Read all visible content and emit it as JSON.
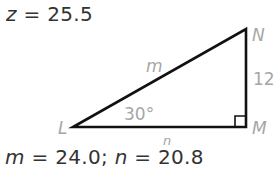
{
  "header": {
    "variable": "z",
    "equals": "=",
    "value": "25.5"
  },
  "triangle": {
    "vertices": {
      "L": {
        "label": "L",
        "x": 73,
        "y": 127
      },
      "M": {
        "label": "M",
        "x": 246,
        "y": 127
      },
      "N": {
        "label": "N",
        "x": 246,
        "y": 29
      }
    },
    "sides": {
      "hypotenuse_label": "m",
      "base_label": "n",
      "vertical_label": "12"
    },
    "angle_label": "30°",
    "right_angle_at": "M",
    "stroke_color": "#111111",
    "label_color": "#a6a6a6"
  },
  "answer": {
    "m_var": "m",
    "m_equals": "=",
    "m_value": "24.0;",
    "n_var": "n",
    "n_equals": "=",
    "n_value": "20.8"
  }
}
